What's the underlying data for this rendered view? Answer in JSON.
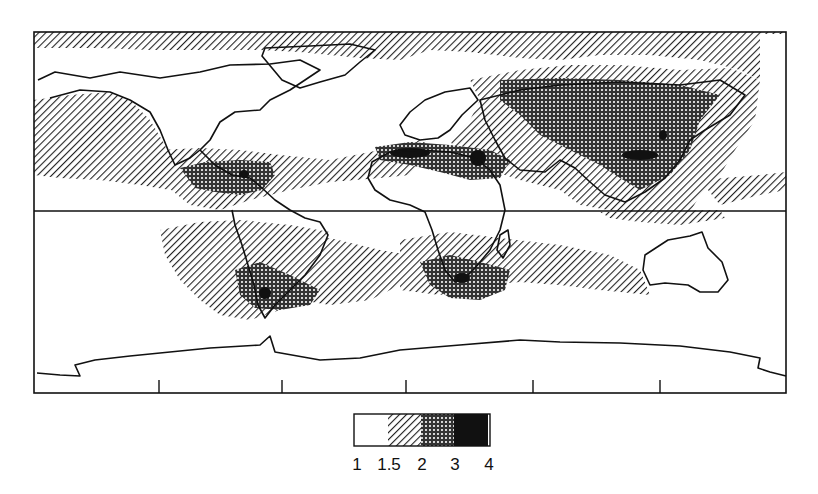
{
  "map": {
    "type": "world-choropleth-hatched",
    "projection": "equirectangular",
    "frame": {
      "left": 34,
      "top": 32,
      "right": 786,
      "bottom": 393
    },
    "equator_line": true,
    "bottom_ticks_count": 5,
    "line_color": "#111111"
  },
  "legend": {
    "bins": [
      {
        "from": "1",
        "to": "1.5",
        "pattern": "white"
      },
      {
        "from": "1.5",
        "to": "2",
        "pattern": "diagonal-hatch"
      },
      {
        "from": "2",
        "to": "3",
        "pattern": "cross-dots"
      },
      {
        "from": "3",
        "to": "4",
        "pattern": "solid-black"
      }
    ],
    "labels": [
      "1",
      "1.5",
      "2",
      "3",
      "4"
    ]
  },
  "regions": {
    "hatch_bands": [
      "North Pacific",
      "Arctic margin",
      "Tropical North Pacific",
      "North Atlantic subtropics",
      "Eurasia",
      "Indian Ocean",
      "South Pacific/South America",
      "South Atlantic",
      "Southern Indian Ocean"
    ],
    "dotted": [
      "Central America/Caribbean",
      "Central Asia & Siberia",
      "China & Southeast Asia",
      "North Africa & Middle East",
      "Southern South America",
      "Southern Africa"
    ],
    "solid": [
      "Sahara (west)",
      "Arabia/Egypt",
      "China (central)",
      "Mexico/Gulf",
      "Patagonia",
      "Southern Africa (Kalahari)"
    ]
  }
}
